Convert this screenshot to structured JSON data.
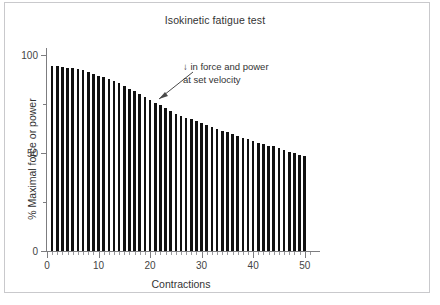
{
  "chart_data": {
    "type": "bar",
    "title": "Isokinetic fatigue test",
    "xlabel": "Contractions",
    "ylabel": "% Maximal force or power",
    "xlim": [
      0,
      52
    ],
    "ylim": [
      0,
      105
    ],
    "xticks": [
      0,
      10,
      20,
      30,
      40,
      50
    ],
    "yticks": [
      0,
      50,
      100
    ],
    "yticks_minor": [
      25,
      75
    ],
    "grid": false,
    "legend": null,
    "bar_color": "#111111",
    "categories": [
      1,
      2,
      3,
      4,
      5,
      6,
      7,
      8,
      9,
      10,
      11,
      12,
      13,
      14,
      15,
      16,
      17,
      18,
      19,
      20,
      21,
      22,
      23,
      24,
      25,
      26,
      27,
      28,
      29,
      30,
      31,
      32,
      33,
      34,
      35,
      36,
      37,
      38,
      39,
      40,
      41,
      42,
      43,
      44,
      45,
      46,
      47,
      48,
      49,
      50
    ],
    "values": [
      99,
      99,
      98.5,
      98,
      98,
      97.5,
      97,
      96,
      95,
      94,
      93,
      92,
      91,
      90,
      88.5,
      87,
      85.5,
      84,
      82.5,
      81,
      79.5,
      78,
      76.5,
      75,
      73.5,
      72.5,
      71.5,
      70.5,
      69.5,
      68.5,
      67.5,
      66.5,
      65.5,
      64.5,
      63.5,
      62.5,
      61.5,
      60.5,
      60,
      59,
      58,
      57.5,
      56.5,
      56,
      55,
      54,
      53,
      52.5,
      51.5,
      51
    ],
    "annotations": [
      {
        "name": "decline-annotation",
        "line1": "↓ in force and power",
        "line2": "at set velocity",
        "points_to_contraction": 21,
        "points_to_value": 76
      }
    ]
  }
}
